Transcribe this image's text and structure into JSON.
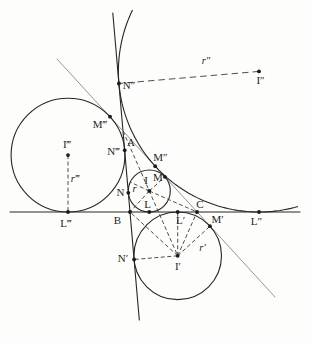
{
  "diagram": {
    "colors": {
      "background": "#fdfdfc",
      "main_stroke": "#262626",
      "light_stroke": "#8a8a8a",
      "dash_stroke": "#3a3a3a",
      "dot_fill": "#1b1b1b",
      "label_fill": "#1d1d1d"
    },
    "canvas": {
      "width": 311,
      "height": 344
    },
    "lines": [
      {
        "name": "line-AB",
        "x1": 112.8,
        "y1": 13,
        "x2": 139.3,
        "y2": 320,
        "w": 1.1,
        "light": false
      },
      {
        "name": "line-BC",
        "x1": 10,
        "y1": 212,
        "x2": 300,
        "y2": 212,
        "w": 1.0,
        "light": false
      },
      {
        "name": "line-CA",
        "x1": 57,
        "y1": 59,
        "x2": 275,
        "y2": 297,
        "w": 0.9,
        "light": true
      }
    ],
    "circles": [
      {
        "name": "incircle",
        "cx": 149.3,
        "cy": 191.0,
        "r": 21.0
      },
      {
        "name": "excircle-opposite-A",
        "cx": 177.7,
        "cy": 255.8,
        "r": 43.8
      },
      {
        "name": "excircle-opposite-C",
        "cx": 68.0,
        "cy": 155.1,
        "r": 56.9
      }
    ],
    "arcs": [
      {
        "name": "excircle-opposite-B-arc",
        "cx": 259.0,
        "cy": 71.4,
        "r": 140.6,
        "from_deg": 205.9,
        "to_deg": 73.1
      }
    ],
    "dashed": [
      {
        "name": "radius-r",
        "x1": 149.3,
        "y1": 191.0,
        "x2": 130.3,
        "y2": 182.1,
        "dash": "4 2.5"
      },
      {
        "name": "radius-r-prime",
        "x1": 177.7,
        "y1": 255.8,
        "x2": 210.0,
        "y2": 226.2,
        "dash": "4 2.5"
      },
      {
        "name": "radius-r-2prime",
        "x1": 259.0,
        "y1": 71.4,
        "x2": 118.9,
        "y2": 83.5,
        "dash": "6.5 4"
      },
      {
        "name": "radius-r-3prime",
        "x1": 68.0,
        "y1": 155.1,
        "x2": 68.0,
        "y2": 212.0,
        "dash": "4 2.5"
      },
      {
        "name": "bisector-A-I-Iprime",
        "x1": 123.0,
        "y1": 131.0,
        "x2": 177.7,
        "y2": 255.8,
        "dash": "4 2.5"
      },
      {
        "name": "segment-I-B",
        "x1": 149.3,
        "y1": 191.0,
        "x2": 130.0,
        "y2": 212.0,
        "dash": "4 2.5"
      },
      {
        "name": "segment-I-C",
        "x1": 149.3,
        "y1": 191.0,
        "x2": 197.0,
        "y2": 212.0,
        "dash": "4 2.5"
      },
      {
        "name": "segment-I-M",
        "x1": 149.3,
        "y1": 191.0,
        "x2": 164.9,
        "y2": 176.8,
        "dash": "4 2.5"
      },
      {
        "name": "segment-Iprime-B",
        "x1": 177.7,
        "y1": 255.8,
        "x2": 130.0,
        "y2": 212.0,
        "dash": "4 2.5"
      },
      {
        "name": "segment-Iprime-C",
        "x1": 177.7,
        "y1": 255.8,
        "x2": 197.0,
        "y2": 212.0,
        "dash": "4 2.5"
      },
      {
        "name": "segment-Iprime-Lprime",
        "x1": 177.7,
        "y1": 255.8,
        "x2": 177.7,
        "y2": 212.0,
        "dash": "4 2.5"
      },
      {
        "name": "segment-Iprime-Nprime",
        "x1": 177.7,
        "y1": 255.8,
        "x2": 134.1,
        "y2": 259.5,
        "dash": "4 2.5"
      }
    ],
    "points": [
      {
        "name": "point-B",
        "x": 130.0,
        "y": 212.0
      },
      {
        "name": "point-C",
        "x": 197.0,
        "y": 212.0
      },
      {
        "name": "point-I",
        "x": 149.3,
        "y": 191.0
      },
      {
        "name": "point-N",
        "x": 128.3,
        "y": 192.8
      },
      {
        "name": "point-M",
        "x": 164.9,
        "y": 176.8
      },
      {
        "name": "point-L",
        "x": 149.3,
        "y": 212.0
      },
      {
        "name": "point-I-prime",
        "x": 177.7,
        "y": 255.8
      },
      {
        "name": "point-N-prime",
        "x": 134.1,
        "y": 259.5
      },
      {
        "name": "point-M-prime",
        "x": 210.0,
        "y": 226.2
      },
      {
        "name": "point-L-prime",
        "x": 177.7,
        "y": 212.0
      },
      {
        "name": "point-I-2prime",
        "x": 259.0,
        "y": 71.4
      },
      {
        "name": "point-N-2prime",
        "x": 118.9,
        "y": 83.5
      },
      {
        "name": "point-M-2prime",
        "x": 155.2,
        "y": 166.2
      },
      {
        "name": "point-L-2prime",
        "x": 259.0,
        "y": 212.0
      },
      {
        "name": "point-I-3prime",
        "x": 68.0,
        "y": 155.1
      },
      {
        "name": "point-N-3prime",
        "x": 124.7,
        "y": 150.2
      },
      {
        "name": "point-M-3prime",
        "x": 110.0,
        "y": 116.7
      },
      {
        "name": "point-L-3prime",
        "x": 68.0,
        "y": 212.0
      }
    ],
    "labels": [
      {
        "name": "label-A",
        "text": "A",
        "x": 131,
        "y": 142
      },
      {
        "name": "label-B",
        "text": "B",
        "x": 117.5,
        "y": 220
      },
      {
        "name": "label-C",
        "text": "C",
        "x": 200,
        "y": 204.5
      },
      {
        "name": "label-I",
        "text": "I",
        "x": 146,
        "y": 180.5
      },
      {
        "name": "label-M",
        "text": "M",
        "x": 158,
        "y": 177.5
      },
      {
        "name": "label-N",
        "text": "N",
        "x": 120.5,
        "y": 192
      },
      {
        "name": "label-L",
        "text": "L",
        "x": 147.5,
        "y": 204
      },
      {
        "name": "label-r",
        "text": "r",
        "x": 134.5,
        "y": 188,
        "italic": true
      },
      {
        "name": "label-I-prime",
        "text": "I′",
        "x": 178,
        "y": 266.5
      },
      {
        "name": "label-L-prime",
        "text": "L′",
        "x": 180.5,
        "y": 220.5
      },
      {
        "name": "label-M-prime",
        "text": "M′",
        "x": 217.5,
        "y": 219.5
      },
      {
        "name": "label-N-prime",
        "text": "N′",
        "x": 123,
        "y": 258.5
      },
      {
        "name": "label-r-prime",
        "text": "r′",
        "x": 202.5,
        "y": 247,
        "italic": true
      },
      {
        "name": "label-I-2prime",
        "text": "I″",
        "x": 260.5,
        "y": 80.5
      },
      {
        "name": "label-L-2prime",
        "text": "L″",
        "x": 256.5,
        "y": 221
      },
      {
        "name": "label-M-2prime",
        "text": "M″",
        "x": 160.5,
        "y": 157.5
      },
      {
        "name": "label-N-2prime",
        "text": "N″",
        "x": 129,
        "y": 85
      },
      {
        "name": "label-r-2prime",
        "text": "r″",
        "x": 206,
        "y": 60.5,
        "italic": true
      },
      {
        "name": "label-I-3prime",
        "text": "I‴",
        "x": 67,
        "y": 144.5
      },
      {
        "name": "label-L-3prime",
        "text": "L‴",
        "x": 66,
        "y": 223
      },
      {
        "name": "label-M-3prime",
        "text": "M‴",
        "x": 100,
        "y": 124
      },
      {
        "name": "label-N-3prime",
        "text": "N‴",
        "x": 113.5,
        "y": 151.5
      },
      {
        "name": "label-r-3prime",
        "text": "r‴",
        "x": 75,
        "y": 178,
        "italic": true
      }
    ]
  }
}
